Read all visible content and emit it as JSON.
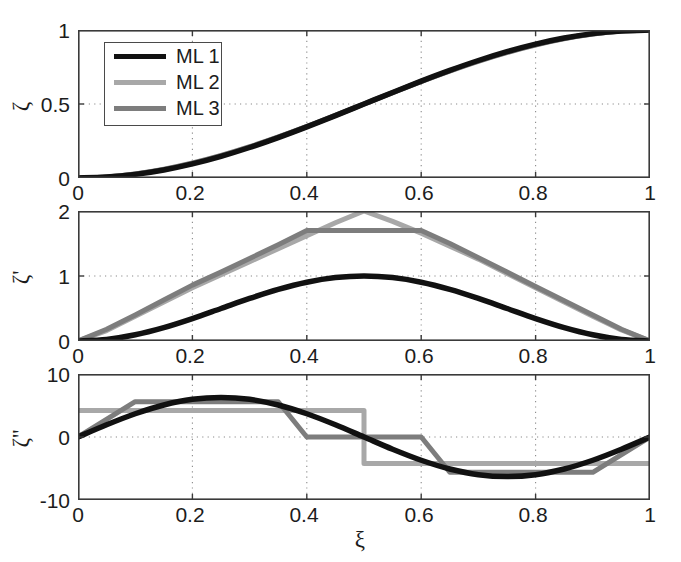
{
  "figure": {
    "width": 681,
    "height": 562,
    "background": "#ffffff"
  },
  "legend": {
    "entries": [
      {
        "label": "ML 1",
        "color": "#111111",
        "width": 5.5
      },
      {
        "label": "ML 2",
        "color": "#a8a8a8",
        "width": 5.0
      },
      {
        "label": "ML 3",
        "color": "#7d7d7d",
        "width": 5.0
      }
    ]
  },
  "axis_titles": {
    "x": "ξ",
    "y_top": "ζ",
    "y_mid": "ζ'",
    "y_bot": "ζ''"
  },
  "chart_data": [
    {
      "type": "line",
      "title": "",
      "panel": "top",
      "xlabel": "",
      "ylabel": "ζ",
      "xlim": [
        0,
        1
      ],
      "ylim": [
        0,
        1
      ],
      "xticks": [
        0,
        0.2,
        0.4,
        0.6,
        0.8,
        1
      ],
      "xticklabels": [
        "0",
        "0.2",
        "0.4",
        "0.6",
        "0.8",
        "1"
      ],
      "yticks": [
        0,
        0.5,
        1
      ],
      "yticklabels": [
        "0",
        "0.5",
        "1"
      ],
      "grid": true,
      "legend_position": "upper left",
      "series": [
        {
          "name": "ML 1",
          "color": "#111111",
          "x": [
            0,
            0.05,
            0.1,
            0.15,
            0.2,
            0.25,
            0.3,
            0.35,
            0.4,
            0.45,
            0.5,
            0.55,
            0.6,
            0.65,
            0.7,
            0.75,
            0.8,
            0.85,
            0.9,
            0.95,
            1
          ],
          "values": [
            0,
            0.0062,
            0.0245,
            0.0545,
            0.0955,
            0.1464,
            0.2061,
            0.273,
            0.3455,
            0.4218,
            0.5,
            0.5782,
            0.6545,
            0.727,
            0.7939,
            0.8536,
            0.9045,
            0.9455,
            0.9755,
            0.9938,
            1
          ]
        },
        {
          "name": "ML 2",
          "color": "#a8a8a8",
          "x": [
            0,
            0.05,
            0.1,
            0.15,
            0.2,
            0.25,
            0.3,
            0.35,
            0.4,
            0.45,
            0.5,
            0.55,
            0.6,
            0.65,
            0.7,
            0.75,
            0.8,
            0.85,
            0.9,
            0.95,
            1
          ],
          "values": [
            0,
            0.0073,
            0.028,
            0.06,
            0.102,
            0.153,
            0.212,
            0.278,
            0.349,
            0.424,
            0.5,
            0.576,
            0.651,
            0.722,
            0.788,
            0.847,
            0.898,
            0.94,
            0.972,
            0.9927,
            1
          ]
        },
        {
          "name": "ML 3",
          "color": "#7d7d7d",
          "x": [
            0,
            0.05,
            0.1,
            0.15,
            0.2,
            0.25,
            0.3,
            0.35,
            0.4,
            0.45,
            0.5,
            0.55,
            0.6,
            0.65,
            0.7,
            0.75,
            0.8,
            0.85,
            0.9,
            0.95,
            1
          ],
          "values": [
            0,
            0.007,
            0.027,
            0.058,
            0.1,
            0.151,
            0.21,
            0.276,
            0.347,
            0.423,
            0.5,
            0.577,
            0.653,
            0.724,
            0.79,
            0.849,
            0.9,
            0.942,
            0.973,
            0.993,
            1
          ]
        }
      ]
    },
    {
      "type": "line",
      "title": "",
      "panel": "middle",
      "xlabel": "",
      "ylabel": "ζ'",
      "xlim": [
        0,
        1
      ],
      "ylim": [
        0,
        2
      ],
      "xticks": [
        0,
        0.2,
        0.4,
        0.6,
        0.8,
        1
      ],
      "xticklabels": [
        "0",
        "0.2",
        "0.4",
        "0.6",
        "0.8",
        "1"
      ],
      "yticks": [
        0,
        1,
        2
      ],
      "yticklabels": [
        "0",
        "1",
        "2"
      ],
      "grid": true,
      "series": [
        {
          "name": "ML 1",
          "color": "#111111",
          "x": [
            0,
            0.05,
            0.1,
            0.15,
            0.2,
            0.25,
            0.3,
            0.35,
            0.4,
            0.45,
            0.5,
            0.55,
            0.6,
            0.65,
            0.7,
            0.75,
            0.8,
            0.85,
            0.9,
            0.95,
            1
          ],
          "values": [
            0,
            0.0245,
            0.0955,
            0.2061,
            0.3455,
            0.5,
            0.6545,
            0.7939,
            0.9045,
            0.9755,
            1.0,
            0.9755,
            0.9045,
            0.7939,
            0.6545,
            0.5,
            0.3455,
            0.2061,
            0.0955,
            0.0245,
            0
          ]
        },
        {
          "name": "ML 2",
          "color": "#a8a8a8",
          "x": [
            0,
            0.05,
            0.1,
            0.15,
            0.2,
            0.25,
            0.3,
            0.35,
            0.4,
            0.45,
            0.5,
            0.55,
            0.6,
            0.65,
            0.7,
            0.75,
            0.8,
            0.85,
            0.9,
            0.95,
            1
          ],
          "values": [
            0,
            0.16,
            0.38,
            0.6,
            0.82,
            1.02,
            1.22,
            1.42,
            1.62,
            1.82,
            2.0,
            1.84,
            1.66,
            1.46,
            1.26,
            1.04,
            0.82,
            0.6,
            0.38,
            0.17,
            0
          ]
        },
        {
          "name": "ML 3",
          "color": "#7d7d7d",
          "x": [
            0,
            0.05,
            0.1,
            0.15,
            0.2,
            0.25,
            0.3,
            0.35,
            0.4,
            0.5,
            0.6,
            0.65,
            0.7,
            0.75,
            0.8,
            0.85,
            0.9,
            0.95,
            1
          ],
          "values": [
            0,
            0.18,
            0.4,
            0.63,
            0.86,
            1.06,
            1.27,
            1.48,
            1.7,
            1.7,
            1.7,
            1.5,
            1.28,
            1.06,
            0.84,
            0.62,
            0.4,
            0.18,
            0
          ]
        }
      ],
      "notes": "ML 3 has a flat plateau at ~1.70 between xi=0.4 and xi=0.6; ML 2 peaks sharply at 2.0 at xi=0.5"
    },
    {
      "type": "line",
      "title": "",
      "panel": "bottom",
      "xlabel": "ξ",
      "ylabel": "ζ''",
      "xlim": [
        0,
        1
      ],
      "ylim": [
        -10,
        10
      ],
      "xticks": [
        0,
        0.2,
        0.4,
        0.6,
        0.8,
        1
      ],
      "xticklabels": [
        "0",
        "0.2",
        "0.4",
        "0.6",
        "0.8",
        "1"
      ],
      "yticks": [
        -10,
        0,
        10
      ],
      "yticklabels": [
        "-10",
        "0",
        "10"
      ],
      "grid": true,
      "series": [
        {
          "name": "ML 1",
          "color": "#111111",
          "x": [
            0,
            0.05,
            0.1,
            0.15,
            0.2,
            0.25,
            0.3,
            0.35,
            0.4,
            0.45,
            0.5,
            0.55,
            0.6,
            0.65,
            0.7,
            0.75,
            0.8,
            0.85,
            0.9,
            0.95,
            1
          ],
          "values": [
            0,
            1.94,
            3.69,
            5.08,
            5.98,
            6.28,
            5.98,
            5.08,
            3.69,
            1.94,
            0,
            -1.94,
            -3.69,
            -5.08,
            -5.98,
            -6.28,
            -5.98,
            -5.08,
            -3.69,
            -1.94,
            0
          ]
        },
        {
          "name": "ML 2",
          "color": "#a8a8a8",
          "x_steps": [
            0,
            0.5,
            0.5,
            1
          ],
          "values_steps": [
            4.2,
            4.2,
            -4.2,
            -4.2
          ],
          "description": "two-level step: +4.2 on [0,0.5), -4.2 on [0.5,1]"
        },
        {
          "name": "ML 3",
          "color": "#7d7d7d",
          "x_piecewise": [
            0,
            0.1,
            0.35,
            0.4,
            0.6,
            0.65,
            0.9,
            1
          ],
          "values_piecewise": [
            0,
            5.6,
            5.6,
            0,
            0,
            -5.6,
            -5.6,
            0
          ],
          "description": "trapezoidal piecewise-linear: ramps up 0->5.6 over [0,0.1], flat 5.6 to 0.35, drops to 0 at 0.4, flat 0 to 0.6, drops to -5.6 at 0.65, flat to 0.9, ramps to 0 at 1"
        }
      ],
      "notes": "ML 2 is a two-level constant step function; ML 3 is piecewise-linear trapezoidal"
    }
  ]
}
